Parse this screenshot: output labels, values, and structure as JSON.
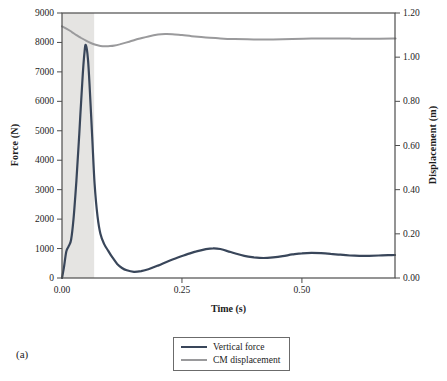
{
  "figure_label": "(a)",
  "colors": {
    "force_line": "#39465a",
    "displacement_line": "#9a9a9c",
    "shaded_region": "#e5e4e2",
    "axis": "#4d4d4d",
    "text": "#1c1c1c"
  },
  "legend": {
    "items": [
      {
        "label": "Vertical force",
        "color_key": "force_line"
      },
      {
        "label": "CM displacement",
        "color_key": "displacement_line"
      }
    ],
    "position": "bottom-center"
  },
  "chart_data": {
    "type": "line",
    "title": "",
    "xlabel": "Time (s)",
    "ylabel_left": "Force (N)",
    "ylabel_right": "Displacement (m)",
    "xlim": [
      0,
      0.694
    ],
    "ylim_left": [
      0,
      9000
    ],
    "ylim_right": [
      0,
      1.2
    ],
    "grid": false,
    "legend_position": "bottom-center",
    "x_ticks": [
      0.0,
      0.25,
      0.5
    ],
    "x_tick_labels": [
      "0.00",
      "0.25",
      "0.50"
    ],
    "y_ticks_left": [
      0,
      1000,
      2000,
      3000,
      4000,
      5000,
      6000,
      7000,
      8000,
      9000
    ],
    "y_tick_labels_left": [
      "0",
      "1000",
      "2000",
      "3000",
      "4000",
      "5000",
      "6000",
      "7000",
      "8000",
      "9000"
    ],
    "y_ticks_right": [
      0.0,
      0.2,
      0.4,
      0.6,
      0.8,
      1.0,
      1.2
    ],
    "y_tick_labels_right": [
      "0.00",
      "0.20",
      "0.40",
      "0.60",
      "0.80",
      "1.00",
      "1.20"
    ],
    "shaded_region_x": [
      0,
      0.067
    ],
    "series": [
      {
        "name": "Vertical force",
        "axis": "left",
        "points": [
          [
            0,
            0
          ],
          [
            0.004,
            350
          ],
          [
            0.009,
            900
          ],
          [
            0.014,
            1080
          ],
          [
            0.019,
            1300
          ],
          [
            0.024,
            2000
          ],
          [
            0.03,
            3300
          ],
          [
            0.036,
            4900
          ],
          [
            0.042,
            6600
          ],
          [
            0.047,
            7700
          ],
          [
            0.05,
            7900
          ],
          [
            0.054,
            7450
          ],
          [
            0.058,
            6400
          ],
          [
            0.063,
            4800
          ],
          [
            0.068,
            3200
          ],
          [
            0.074,
            2100
          ],
          [
            0.08,
            1500
          ],
          [
            0.088,
            1150
          ],
          [
            0.096,
            930
          ],
          [
            0.105,
            700
          ],
          [
            0.115,
            480
          ],
          [
            0.125,
            340
          ],
          [
            0.135,
            260
          ],
          [
            0.15,
            210
          ],
          [
            0.165,
            235
          ],
          [
            0.18,
            300
          ],
          [
            0.2,
            420
          ],
          [
            0.22,
            560
          ],
          [
            0.24,
            690
          ],
          [
            0.26,
            800
          ],
          [
            0.28,
            905
          ],
          [
            0.3,
            980
          ],
          [
            0.315,
            1010
          ],
          [
            0.33,
            985
          ],
          [
            0.345,
            915
          ],
          [
            0.36,
            840
          ],
          [
            0.38,
            750
          ],
          [
            0.4,
            700
          ],
          [
            0.42,
            680
          ],
          [
            0.44,
            700
          ],
          [
            0.46,
            740
          ],
          [
            0.48,
            800
          ],
          [
            0.5,
            840
          ],
          [
            0.52,
            855
          ],
          [
            0.54,
            845
          ],
          [
            0.56,
            820
          ],
          [
            0.58,
            790
          ],
          [
            0.6,
            765
          ],
          [
            0.62,
            755
          ],
          [
            0.64,
            755
          ],
          [
            0.66,
            765
          ],
          [
            0.68,
            775
          ],
          [
            0.694,
            780
          ]
        ]
      },
      {
        "name": "CM displacement",
        "axis": "right",
        "points": [
          [
            0,
            1.14
          ],
          [
            0.01,
            1.128
          ],
          [
            0.02,
            1.115
          ],
          [
            0.03,
            1.1
          ],
          [
            0.04,
            1.087
          ],
          [
            0.05,
            1.075
          ],
          [
            0.06,
            1.064
          ],
          [
            0.07,
            1.056
          ],
          [
            0.08,
            1.051
          ],
          [
            0.09,
            1.049
          ],
          [
            0.1,
            1.05
          ],
          [
            0.11,
            1.053
          ],
          [
            0.12,
            1.058
          ],
          [
            0.14,
            1.07
          ],
          [
            0.16,
            1.083
          ],
          [
            0.18,
            1.094
          ],
          [
            0.2,
            1.102
          ],
          [
            0.215,
            1.105
          ],
          [
            0.23,
            1.104
          ],
          [
            0.25,
            1.1
          ],
          [
            0.27,
            1.095
          ],
          [
            0.3,
            1.089
          ],
          [
            0.33,
            1.085
          ],
          [
            0.36,
            1.082
          ],
          [
            0.4,
            1.08
          ],
          [
            0.44,
            1.08
          ],
          [
            0.48,
            1.082
          ],
          [
            0.52,
            1.084
          ],
          [
            0.56,
            1.085
          ],
          [
            0.6,
            1.084
          ],
          [
            0.64,
            1.083
          ],
          [
            0.69,
            1.084
          ],
          [
            0.694,
            1.084
          ]
        ]
      }
    ]
  }
}
